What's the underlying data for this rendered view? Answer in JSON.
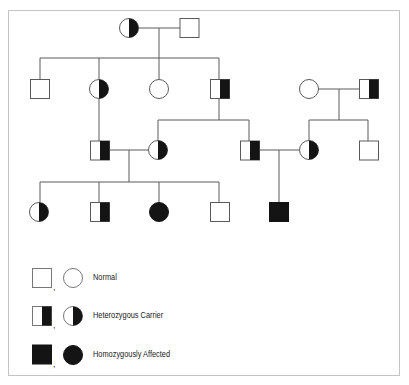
{
  "colors": {
    "line": "#5a5a5a",
    "fill_affected": "#141414",
    "fill_normal": "#ffffff",
    "frame": "#c4c4c4"
  },
  "pedigree": {
    "generations": [
      {
        "name": "I",
        "individuals": [
          {
            "id": "I-1",
            "sex": "female",
            "status": "carrier"
          },
          {
            "id": "I-2",
            "sex": "male",
            "status": "normal"
          }
        ]
      },
      {
        "name": "II",
        "individuals": [
          {
            "id": "II-1",
            "sex": "male",
            "status": "normal"
          },
          {
            "id": "II-2",
            "sex": "female",
            "status": "carrier"
          },
          {
            "id": "II-3",
            "sex": "female",
            "status": "normal"
          },
          {
            "id": "II-4",
            "sex": "male",
            "status": "carrier"
          },
          {
            "id": "II-5",
            "sex": "female",
            "status": "normal"
          },
          {
            "id": "II-6",
            "sex": "male",
            "status": "carrier"
          }
        ]
      },
      {
        "name": "III",
        "individuals": [
          {
            "id": "III-1",
            "sex": "male",
            "status": "carrier"
          },
          {
            "id": "III-2",
            "sex": "female",
            "status": "carrier"
          },
          {
            "id": "III-3",
            "sex": "male",
            "status": "carrier"
          },
          {
            "id": "III-4",
            "sex": "female",
            "status": "carrier"
          },
          {
            "id": "III-5",
            "sex": "male",
            "status": "normal"
          }
        ]
      },
      {
        "name": "IV",
        "individuals": [
          {
            "id": "IV-1",
            "sex": "female",
            "status": "carrier"
          },
          {
            "id": "IV-2",
            "sex": "male",
            "status": "carrier"
          },
          {
            "id": "IV-3",
            "sex": "female",
            "status": "affected"
          },
          {
            "id": "IV-4",
            "sex": "male",
            "status": "normal"
          },
          {
            "id": "IV-5",
            "sex": "male",
            "status": "affected"
          }
        ]
      }
    ]
  },
  "legend": {
    "items": [
      {
        "label": "Normal",
        "status": "normal",
        "separator": ","
      },
      {
        "label": "Heterozygous Carrier",
        "status": "carrier",
        "separator": ","
      },
      {
        "label": "Homozygously Affected",
        "status": "affected",
        "separator": ","
      }
    ]
  }
}
